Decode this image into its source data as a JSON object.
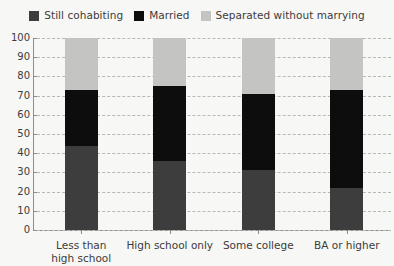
{
  "chart_data": {
    "type": "bar",
    "subtype": "stacked-bar-100",
    "title": "",
    "subtitle": "",
    "xlabel": "",
    "ylabel": "",
    "categories": [
      "Less than high school",
      "High school only",
      "Some college",
      "BA or higher"
    ],
    "series": [
      {
        "name": "Still cohabiting",
        "color": "#3d3d3d",
        "values": [
          44,
          36,
          31,
          22
        ]
      },
      {
        "name": "Married",
        "color": "#0d0d0d",
        "values": [
          29,
          39,
          40,
          51
        ]
      },
      {
        "name": "Separated without marrying",
        "color": "#c4c4c2",
        "values": [
          27,
          25,
          29,
          27
        ]
      }
    ],
    "ylim": [
      0,
      100
    ],
    "yticks": [
      0,
      10,
      20,
      30,
      40,
      50,
      60,
      70,
      80,
      90,
      100
    ],
    "ytick_labels": [
      "0",
      "10",
      "20",
      "30",
      "40",
      "50",
      "60",
      "70",
      "80",
      "90",
      "100"
    ],
    "grid": true,
    "grid_axis": "y",
    "grid_style": "dashed",
    "legend_position": "top-center",
    "background_color": "#f7f7f5",
    "axis_color": "#8d8d8a",
    "grid_color": "#b9b9b4",
    "text_color": "#3c3c3b"
  },
  "legend": {
    "entries": [
      {
        "label": "Still cohabiting",
        "color": "#3d3d3d"
      },
      {
        "label": "Married",
        "color": "#0d0d0d"
      },
      {
        "label": "Separated without marrying",
        "color": "#c4c4c2"
      }
    ]
  },
  "x_axis": {
    "labels": [
      {
        "line1": "Less than",
        "line2": "high school"
      },
      {
        "line1": "High school only",
        "line2": ""
      },
      {
        "line1": "Some college",
        "line2": ""
      },
      {
        "line1": "BA or higher",
        "line2": ""
      }
    ]
  },
  "y_axis": {
    "labels": [
      "100",
      "90",
      "80",
      "70",
      "60",
      "50",
      "40",
      "30",
      "20",
      "10",
      "0"
    ]
  }
}
